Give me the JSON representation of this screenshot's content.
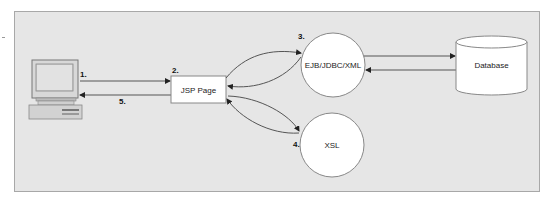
{
  "diagram": {
    "nodes": {
      "client": {
        "type": "computer",
        "label": ""
      },
      "jsp": {
        "type": "box",
        "label": "JSP Page"
      },
      "ejb": {
        "type": "circle",
        "label": "EJB/JDBC/XML"
      },
      "xsl": {
        "type": "circle",
        "label": "XSL"
      },
      "database": {
        "type": "cylinder",
        "label": "Database"
      }
    },
    "steps": {
      "s1": "1.",
      "s2": "2.",
      "s3": "3.",
      "s4": "4.",
      "s5": "5."
    },
    "edges": [
      {
        "from": "client",
        "to": "jsp",
        "step": "1."
      },
      {
        "from": "jsp",
        "to": "client",
        "step": "5."
      },
      {
        "from": "jsp",
        "to": "ejb",
        "style": "curved"
      },
      {
        "from": "ejb",
        "to": "jsp",
        "style": "curved"
      },
      {
        "from": "jsp",
        "to": "xsl",
        "style": "curved"
      },
      {
        "from": "xsl",
        "to": "jsp",
        "style": "curved"
      },
      {
        "from": "ejb",
        "to": "database"
      },
      {
        "from": "database",
        "to": "ejb"
      }
    ],
    "colors": {
      "background": "#e6e6e6",
      "frame_border": "#a8a8a8",
      "node_fill": "#ffffff",
      "line": "#555555"
    }
  }
}
